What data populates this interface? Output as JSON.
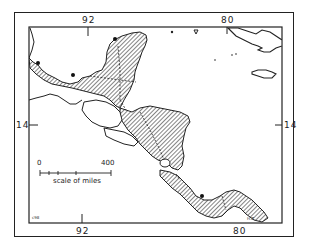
{
  "map": {
    "title": "",
    "region": "Central America",
    "longitude_labels": {
      "top_left": "92",
      "top_right": "80",
      "bottom_left": "92",
      "bottom_right": "80"
    },
    "latitude_labels": {
      "left": "14",
      "right": "14"
    },
    "scale_bar": {
      "start": "0",
      "end": "400",
      "caption": "scale of miles"
    },
    "corner_marks": {
      "bottom_left": "c98",
      "bottom_right": "H.Z."
    },
    "colors": {
      "ink": "#222222",
      "background": "#ffffff"
    }
  }
}
